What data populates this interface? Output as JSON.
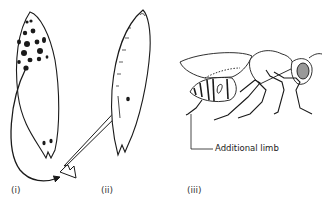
{
  "figure": {
    "panels": [
      {
        "id": "i",
        "label": "(i)",
        "description": "Embryo with cytoplasm transplanted from anterior spots to posterior end"
      },
      {
        "id": "ii",
        "label": "(ii)",
        "description": "Host embryo receiving transplanted material"
      },
      {
        "id": "iii",
        "label": "(iii)",
        "description": "Adult insect with additional limb"
      }
    ],
    "callouts": {
      "additional_limb": "Additional limb"
    },
    "colors": {
      "line": "#1a1a1a",
      "background": "#ffffff"
    }
  }
}
